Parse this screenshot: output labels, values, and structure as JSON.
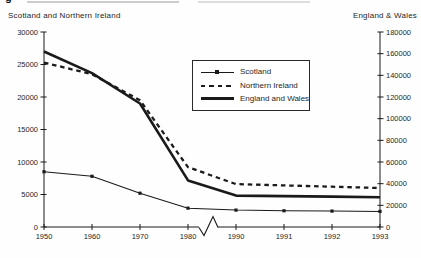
{
  "figure": {
    "cropped_title_fragment": "g"
  },
  "chart_data": {
    "type": "line",
    "left_axis_title": "Scotland and Northern Ireland",
    "right_axis_title": "England & Wales",
    "x_labels": [
      "1950",
      "1960",
      "1970",
      "1980",
      "1990",
      "1991",
      "1992",
      "1993"
    ],
    "x_axis_break_between": [
      "1980",
      "1990"
    ],
    "left_axis": {
      "min": 0,
      "max": 30000,
      "ticks": [
        0,
        5000,
        10000,
        15000,
        20000,
        25000,
        30000
      ]
    },
    "right_axis": {
      "min": 0,
      "max": 180000,
      "ticks": [
        0,
        20000,
        40000,
        60000,
        80000,
        100000,
        120000,
        140000,
        160000,
        180000
      ]
    },
    "series": [
      {
        "name": "Scotland",
        "axis": "left",
        "line_style": "thin-solid-with-square-markers",
        "values": [
          8500,
          7800,
          5200,
          2900,
          2600,
          2500,
          2450,
          2400
        ]
      },
      {
        "name": "Northern Ireland",
        "axis": "left",
        "line_style": "dashed",
        "values": [
          25300,
          23500,
          19500,
          9200,
          6600,
          6400,
          6200,
          6000
        ]
      },
      {
        "name": "England and Wales",
        "axis": "right",
        "line_style": "thick-solid",
        "values": [
          162000,
          142000,
          114000,
          43000,
          29000,
          28500,
          28000,
          27500
        ]
      }
    ],
    "legend": {
      "position": "upper-center",
      "entries": [
        "Scotland",
        "Northern Ireland",
        "England and Wales"
      ]
    },
    "grid": false,
    "colors": {
      "ink": "#1a1a1a",
      "background": "#ffffff"
    }
  }
}
